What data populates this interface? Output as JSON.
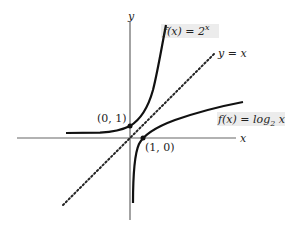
{
  "diagram": {
    "type": "function-graph",
    "axes": {
      "x_label": "x",
      "y_label": "y"
    },
    "curves": [
      {
        "name": "exponential",
        "label": "f(x) = 2^x",
        "label_prefix": "f(x) = 2",
        "label_sup": "x"
      },
      {
        "name": "logarithm",
        "label": "f(x) = log2 x",
        "label_prefix": "f(x) = log",
        "label_sub": "2",
        "label_suffix": " x"
      },
      {
        "name": "identity",
        "label": "y = x",
        "style": "dotted"
      }
    ],
    "points": [
      {
        "label": "(0, 1)",
        "x": 0,
        "y": 1
      },
      {
        "label": "(1, 0)",
        "x": 1,
        "y": 0
      }
    ],
    "colors": {
      "curve": "#111111",
      "axis": "#555555",
      "label_bg": "#e6e6e6"
    }
  }
}
